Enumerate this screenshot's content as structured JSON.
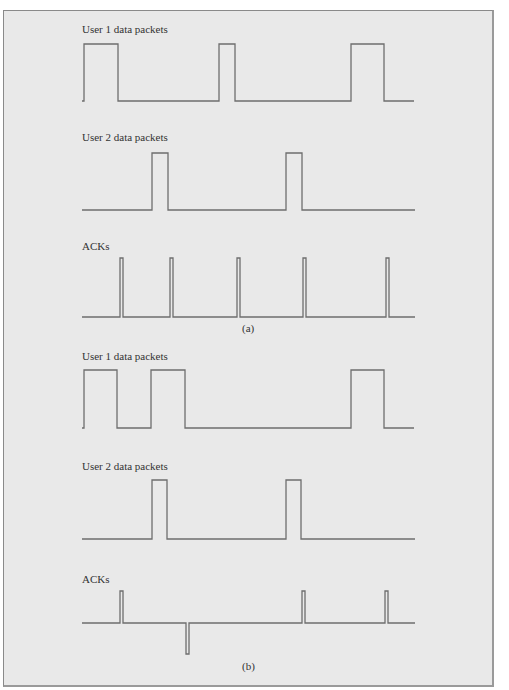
{
  "figure": {
    "panels": [
      {
        "caption": "(a)",
        "rows": [
          {
            "label": "User 1 data packets",
            "baseline_y": 101,
            "high_y": 44,
            "start_x": 82,
            "end_x": 414,
            "pulses": [
              [
                84,
                118
              ],
              [
                219,
                235
              ],
              [
                351,
                384
              ]
            ]
          },
          {
            "label": "User 2 data packets",
            "baseline_y": 210,
            "high_y": 153,
            "start_x": 82,
            "end_x": 415,
            "pulses": [
              [
                152,
                168
              ],
              [
                286,
                302
              ]
            ]
          },
          {
            "label": "ACKs",
            "baseline_y": 317,
            "high_y": 258,
            "start_x": 82,
            "end_x": 415,
            "pulses": [
              [
                120,
                123
              ],
              [
                170,
                173
              ],
              [
                237,
                240
              ],
              [
                303,
                306
              ],
              [
                386,
                389
              ]
            ]
          }
        ]
      },
      {
        "caption": "(b)",
        "rows": [
          {
            "label": "User 1 data packets",
            "baseline_y": 428,
            "high_y": 370,
            "start_x": 82,
            "end_x": 414,
            "pulses": [
              [
                84,
                117
              ],
              [
                151,
                185
              ],
              [
                351,
                384
              ]
            ]
          },
          {
            "label": "User 2 data packets",
            "baseline_y": 539,
            "high_y": 480,
            "start_x": 82,
            "end_x": 415,
            "pulses": [
              [
                152,
                167
              ],
              [
                286,
                301
              ]
            ]
          },
          {
            "label": "ACKs",
            "baseline_y": 623,
            "high_y": 591,
            "low_y": 654,
            "start_x": 82,
            "end_x": 415,
            "pulses": [
              [
                120,
                123
              ],
              [
                302,
                305
              ],
              [
                385,
                388
              ]
            ],
            "down_pulses": [
              [
                186,
                189
              ]
            ]
          }
        ]
      }
    ]
  }
}
